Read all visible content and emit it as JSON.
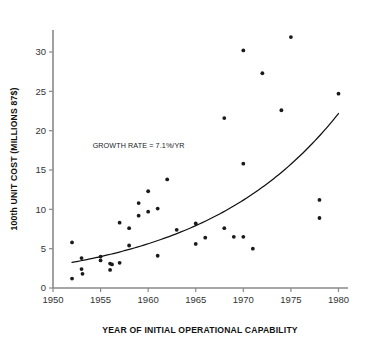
{
  "chart_data": {
    "type": "scatter",
    "title": "",
    "xlabel": "YEAR OF INITIAL OPERATIONAL CAPABILITY",
    "ylabel": "100th UNIT COST (MILLIONS 87$)",
    "xlim": [
      1950,
      1981
    ],
    "ylim": [
      0,
      32.8
    ],
    "xticks": [
      1950,
      1955,
      1960,
      1965,
      1970,
      1975,
      1980
    ],
    "yticks": [
      0,
      5,
      10,
      15,
      20,
      25,
      30
    ],
    "xtick_labels": [
      "1950",
      "1955",
      "1960",
      "1965",
      "1970",
      "1975",
      "1980"
    ],
    "ytick_labels": [
      "0",
      "5",
      "10",
      "15",
      "20",
      "25",
      "30"
    ],
    "grid": false,
    "legend": false,
    "annotations": [
      {
        "text": "GROWTH RATE = 7.1%/YR",
        "x": 1959.0,
        "y": 17.8
      }
    ],
    "series": [
      {
        "name": "100th unit cost",
        "marker": "circle",
        "color": "#1a1a1a",
        "points": [
          {
            "x": 1952.0,
            "y": 5.8
          },
          {
            "x": 1952.0,
            "y": 1.2
          },
          {
            "x": 1953.0,
            "y": 3.8
          },
          {
            "x": 1953.0,
            "y": 2.4
          },
          {
            "x": 1953.1,
            "y": 1.8
          },
          {
            "x": 1955.0,
            "y": 4.0
          },
          {
            "x": 1955.0,
            "y": 3.5
          },
          {
            "x": 1956.0,
            "y": 3.1
          },
          {
            "x": 1956.2,
            "y": 3.0
          },
          {
            "x": 1956.0,
            "y": 2.3
          },
          {
            "x": 1957.0,
            "y": 3.2
          },
          {
            "x": 1957.0,
            "y": 8.3
          },
          {
            "x": 1958.0,
            "y": 7.6
          },
          {
            "x": 1958.0,
            "y": 5.4
          },
          {
            "x": 1959.0,
            "y": 10.8
          },
          {
            "x": 1959.0,
            "y": 9.2
          },
          {
            "x": 1960.0,
            "y": 12.3
          },
          {
            "x": 1960.0,
            "y": 9.7
          },
          {
            "x": 1961.0,
            "y": 10.1
          },
          {
            "x": 1961.0,
            "y": 4.1
          },
          {
            "x": 1962.0,
            "y": 13.8
          },
          {
            "x": 1963.0,
            "y": 7.4
          },
          {
            "x": 1965.0,
            "y": 8.2
          },
          {
            "x": 1965.0,
            "y": 5.6
          },
          {
            "x": 1966.0,
            "y": 6.4
          },
          {
            "x": 1968.0,
            "y": 21.6
          },
          {
            "x": 1968.0,
            "y": 7.6
          },
          {
            "x": 1969.0,
            "y": 6.5
          },
          {
            "x": 1970.0,
            "y": 30.2
          },
          {
            "x": 1970.0,
            "y": 15.8
          },
          {
            "x": 1970.0,
            "y": 6.5
          },
          {
            "x": 1971.0,
            "y": 5.0
          },
          {
            "x": 1972.0,
            "y": 27.3
          },
          {
            "x": 1974.0,
            "y": 22.6
          },
          {
            "x": 1975.0,
            "y": 31.9
          },
          {
            "x": 1978.0,
            "y": 11.2
          },
          {
            "x": 1978.0,
            "y": 8.9
          },
          {
            "x": 1980.0,
            "y": 24.7
          }
        ]
      }
    ],
    "trend": {
      "name": "exponential growth fit",
      "growth_rate_pct_per_year": 7.1,
      "x_start": 1952.0,
      "x_end": 1980.0,
      "y_start": 3.25,
      "y_end": 24.7,
      "color": "#111111"
    }
  },
  "axis": {
    "x_title": "YEAR OF INITIAL OPERATIONAL CAPABILITY",
    "y_title": "100th UNIT COST (MILLIONS 87$)"
  }
}
